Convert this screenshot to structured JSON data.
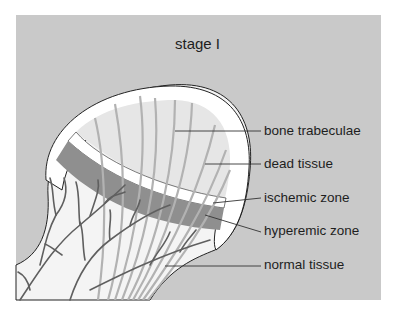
{
  "diagram": {
    "title": "stage I",
    "colors": {
      "background_panel": "#c9c9c9",
      "bone_cortex": "#ffffff",
      "dead_tissue": "#e6e6e6",
      "ischemic_zone": "#ffffff",
      "hyperemic_zone": "#8f8f8f",
      "trabeculae": "#b2b2b2",
      "vessels": "#5f5f5f",
      "leader_lines": "#333333"
    },
    "labels": [
      {
        "text": "bone trabeculae",
        "y": 123
      },
      {
        "text": "dead tissue",
        "y": 156
      },
      {
        "text": "ischemic zone",
        "y": 190
      },
      {
        "text": "hyperemic zone",
        "y": 223
      },
      {
        "text": "normal tissue",
        "y": 257
      }
    ]
  }
}
